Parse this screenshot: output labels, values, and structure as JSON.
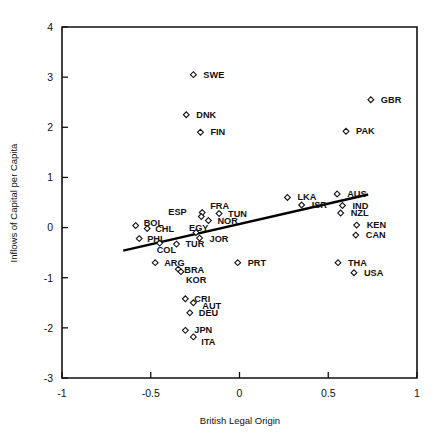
{
  "chart_data": {
    "type": "scatter",
    "title": "",
    "xlabel": "British Legal Origin",
    "ylabel": "Inflows of Capital per Capita",
    "xlim": [
      -1,
      1
    ],
    "ylim": [
      -3,
      4
    ],
    "xticks": [
      "-1",
      "-0.5",
      "0",
      "0.5",
      "1"
    ],
    "xtick_values": [
      -1,
      -0.5,
      0,
      0.5,
      1
    ],
    "yticks": [
      "-3",
      "-2",
      "-1",
      "0",
      "1",
      "2",
      "3",
      "4"
    ],
    "ytick_values": [
      -3,
      -2,
      -1,
      0,
      1,
      2,
      3,
      4
    ],
    "grid": false,
    "legend": null,
    "marker_style": "open-diamond",
    "points": [
      {
        "label": "SWE",
        "x": -0.26,
        "y": 3.05,
        "lx": 10,
        "ly": 3
      },
      {
        "label": "GBR",
        "x": 0.74,
        "y": 2.55,
        "lx": 10,
        "ly": 3
      },
      {
        "label": "DNK",
        "x": -0.3,
        "y": 2.25,
        "lx": 10,
        "ly": 3
      },
      {
        "label": "FIN",
        "x": -0.22,
        "y": 1.9,
        "lx": 10,
        "ly": 3
      },
      {
        "label": "PAK",
        "x": 0.6,
        "y": 1.92,
        "lx": 10,
        "ly": 3
      },
      {
        "label": "LKA",
        "x": 0.27,
        "y": 0.6,
        "lx": 10,
        "ly": 3
      },
      {
        "label": "AUS",
        "x": 0.55,
        "y": 0.67,
        "lx": 10,
        "ly": 3
      },
      {
        "label": "ISR",
        "x": 0.35,
        "y": 0.45,
        "lx": 10,
        "ly": 3
      },
      {
        "label": "IND",
        "x": 0.58,
        "y": 0.44,
        "lx": 10,
        "ly": 3
      },
      {
        "label": "NZL",
        "x": 0.57,
        "y": 0.29,
        "lx": 10,
        "ly": 3
      },
      {
        "label": "FRA",
        "x": -0.21,
        "y": 0.3,
        "lx": 8,
        "ly": -4
      },
      {
        "label": "ESP",
        "x": -0.215,
        "y": 0.22,
        "lx": -33,
        "ly": -2
      },
      {
        "label": "TUN",
        "x": -0.115,
        "y": 0.28,
        "lx": 9,
        "ly": 3
      },
      {
        "label": "NOR",
        "x": -0.175,
        "y": 0.14,
        "lx": 9,
        "ly": 3
      },
      {
        "label": "KEN",
        "x": 0.66,
        "y": 0.05,
        "lx": 10,
        "ly": 3
      },
      {
        "label": "BOL",
        "x": -0.585,
        "y": 0.04,
        "lx": 8,
        "ly": 0
      },
      {
        "label": "CHL",
        "x": -0.52,
        "y": -0.02,
        "lx": 8,
        "ly": 3
      },
      {
        "label": "CAN",
        "x": 0.655,
        "y": -0.15,
        "lx": 10,
        "ly": 3
      },
      {
        "label": "EGY",
        "x": -0.245,
        "y": -0.1,
        "lx": -7,
        "ly": -2
      },
      {
        "label": "PHL",
        "x": -0.565,
        "y": -0.22,
        "lx": 8,
        "ly": 3
      },
      {
        "label": "JOR",
        "x": -0.225,
        "y": -0.21,
        "lx": 10,
        "ly": 4
      },
      {
        "label": "TUR",
        "x": -0.355,
        "y": -0.33,
        "lx": 9,
        "ly": 3
      },
      {
        "label": "COL",
        "x": -0.45,
        "y": -0.31,
        "lx": -3,
        "ly": 10
      },
      {
        "label": "ARG",
        "x": -0.475,
        "y": -0.7,
        "lx": 9,
        "ly": 3
      },
      {
        "label": "PRT",
        "x": -0.01,
        "y": -0.7,
        "lx": 10,
        "ly": 3
      },
      {
        "label": "THA",
        "x": 0.555,
        "y": -0.7,
        "lx": 10,
        "ly": 3
      },
      {
        "label": "BRA",
        "x": -0.345,
        "y": -0.83,
        "lx": 6,
        "ly": 4
      },
      {
        "label": "USA",
        "x": 0.645,
        "y": -0.9,
        "lx": 10,
        "ly": 3
      },
      {
        "label": "KOR",
        "x": -0.33,
        "y": -0.88,
        "lx": 5,
        "ly": 11
      },
      {
        "label": "CRI",
        "x": -0.305,
        "y": -1.42,
        "lx": 9,
        "ly": 3
      },
      {
        "label": "AUT",
        "x": -0.26,
        "y": -1.5,
        "lx": 9,
        "ly": 6
      },
      {
        "label": "DEU",
        "x": -0.28,
        "y": -1.7,
        "lx": 9,
        "ly": 3
      },
      {
        "label": "JPN",
        "x": -0.305,
        "y": -2.05,
        "lx": 9,
        "ly": 3
      },
      {
        "label": "ITA",
        "x": -0.26,
        "y": -2.18,
        "lx": 8,
        "ly": 8
      }
    ],
    "trendline": {
      "x0": -0.655,
      "y0": -0.46,
      "x1": 0.725,
      "y1": 0.66
    }
  }
}
